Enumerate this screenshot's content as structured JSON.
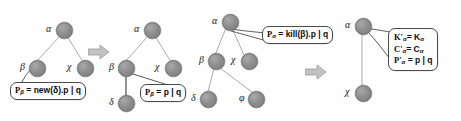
{
  "figure": {
    "type": "process-calculus tree transformation diagram",
    "panel_count": 4,
    "colors": {
      "node_fill": "#8e8e8e",
      "node_stroke": "#6d6d6d",
      "edge": "#9a9a9a",
      "box_stroke": "#4a4a4a",
      "box_fill": "#fdfdfd",
      "text": "#0d0d0d",
      "arrow": "#b5b5b5",
      "background": "#fefefe"
    },
    "transition_arrows": [
      {
        "name": "arrow-1",
        "glyph": "⇒"
      },
      {
        "name": "arrow-2",
        "glyph": "⇒"
      }
    ]
  },
  "panels": [
    {
      "id": "panel-1",
      "caption": "before new(delta)",
      "nodes": [
        {
          "id": "n1-alpha",
          "label": "α",
          "name": "alpha"
        },
        {
          "id": "n1-beta",
          "label": "β",
          "name": "beta"
        },
        {
          "id": "n1-chi",
          "label": "χ",
          "name": "chi"
        }
      ],
      "edges": [
        {
          "from": "α",
          "to": "β"
        },
        {
          "from": "α",
          "to": "χ"
        }
      ],
      "callouts": [
        {
          "id": "callout-1",
          "target": "β",
          "lines": [
            {
              "lhs": "P",
              "sub": "β",
              "rhs": "= new(δ).p | q"
            }
          ],
          "text": "P β = new(δ).p | q"
        }
      ]
    },
    {
      "id": "panel-2",
      "caption": "after new(delta) — delta child created",
      "nodes": [
        {
          "id": "n2-alpha",
          "label": "α",
          "name": "alpha"
        },
        {
          "id": "n2-beta",
          "label": "β",
          "name": "beta"
        },
        {
          "id": "n2-chi",
          "label": "χ",
          "name": "chi"
        },
        {
          "id": "n2-delta",
          "label": "δ",
          "name": "delta"
        }
      ],
      "edges": [
        {
          "from": "α",
          "to": "β"
        },
        {
          "from": "α",
          "to": "χ"
        },
        {
          "from": "β",
          "to": "δ"
        }
      ],
      "callouts": [
        {
          "id": "callout-2",
          "target": "β",
          "lines": [
            {
              "lhs": "P",
              "sub": "β",
              "rhs": "= p | q"
            }
          ],
          "text": "P β = p | q"
        }
      ]
    },
    {
      "id": "panel-3",
      "caption": "before kill(beta)",
      "nodes": [
        {
          "id": "n3-alpha",
          "label": "α",
          "name": "alpha"
        },
        {
          "id": "n3-beta",
          "label": "β",
          "name": "beta"
        },
        {
          "id": "n3-chi",
          "label": "χ",
          "name": "chi"
        },
        {
          "id": "n3-delta",
          "label": "δ",
          "name": "delta"
        },
        {
          "id": "n3-phi",
          "label": "φ",
          "name": "phi"
        }
      ],
      "edges": [
        {
          "from": "α",
          "to": "β"
        },
        {
          "from": "α",
          "to": "χ"
        },
        {
          "from": "β",
          "to": "δ"
        },
        {
          "from": "β",
          "to": "φ"
        }
      ],
      "callouts": [
        {
          "id": "callout-3",
          "target": "α",
          "lines": [
            {
              "lhs": "P",
              "sub": "α",
              "rhs": "= kill(β).p | q"
            }
          ],
          "text": "P α = kill(β).p | q"
        }
      ]
    },
    {
      "id": "panel-4",
      "caption": "after kill(beta) — subtree removed",
      "nodes": [
        {
          "id": "n4-alpha",
          "label": "α",
          "name": "alpha"
        },
        {
          "id": "n4-chi",
          "label": "χ",
          "name": "chi"
        }
      ],
      "edges": [
        {
          "from": "α",
          "to": "χ"
        }
      ],
      "callouts": [
        {
          "id": "callout-4",
          "target": "α",
          "lines": [
            {
              "lhs": "K'",
              "sub": "α",
              "rhs": "= K",
              "rhs_sub": "α"
            },
            {
              "lhs": "C'",
              "sub": "α",
              "rhs": "= C",
              "rhs_sub": "α"
            },
            {
              "lhs": "P'",
              "sub": "α",
              "rhs": "= p | q"
            }
          ],
          "text": "K'α = Kα ; C'α = Cα ; P'α = p | q"
        }
      ]
    }
  ],
  "labels": {
    "p1_alpha": "α",
    "p1_beta": "β",
    "p1_chi": "χ",
    "p2_alpha": "α",
    "p2_beta": "β",
    "p2_chi": "χ",
    "p2_delta": "δ",
    "p3_alpha": "α",
    "p3_beta": "β",
    "p3_chi": "χ",
    "p3_delta": "δ",
    "p3_phi": "φ",
    "p4_alpha": "α",
    "p4_chi": "χ"
  },
  "callout_text": {
    "c1_lhs": "P",
    "c1_sub": "β",
    "c1_rhs": "= new(δ).p | q",
    "c2_lhs": "P",
    "c2_sub": "β",
    "c2_rhs": "= p | q",
    "c3_lhs": "P",
    "c3_sub": "α",
    "c3_rhs": "= kill(β).p | q",
    "c4_l1_lhs": "K'",
    "c4_l1_sub": "α",
    "c4_l1_rhs": "= K",
    "c4_l1_rsub": "α",
    "c4_l2_lhs": "C'",
    "c4_l2_sub": "α",
    "c4_l2_rhs": "= C",
    "c4_l2_rsub": "α",
    "c4_l3_lhs": "P'",
    "c4_l3_sub": "α",
    "c4_l3_rhs": "= p | q"
  }
}
